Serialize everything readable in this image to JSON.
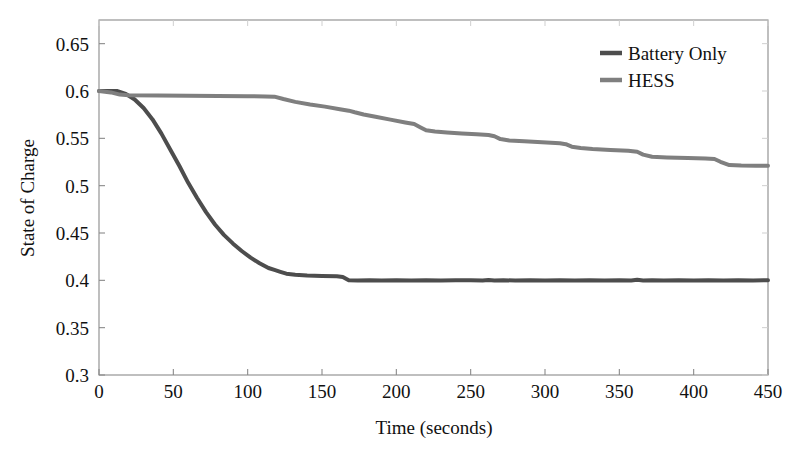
{
  "chart_data": {
    "type": "line",
    "title": "",
    "xlabel": "Time (seconds)",
    "ylabel": "State of Charge",
    "xlim": [
      0,
      450
    ],
    "ylim": [
      0.3,
      0.675
    ],
    "xticks": [
      0,
      50,
      100,
      150,
      200,
      250,
      300,
      350,
      400,
      450
    ],
    "xtick_labels": [
      "0",
      "50",
      "100",
      "150",
      "200",
      "250",
      "300",
      "350",
      "400",
      "450"
    ],
    "yticks": [
      0.3,
      0.35,
      0.4,
      0.45,
      0.5,
      0.55,
      0.6,
      0.65
    ],
    "ytick_labels": [
      "0.3",
      "0.35",
      "0.4",
      "0.45",
      "0.5",
      "0.55",
      "0.6",
      "0.65"
    ],
    "grid": false,
    "legend_position": "top-right",
    "series": [
      {
        "name": "Battery Only",
        "color": "#4d4d4d",
        "linewidth": 4.0,
        "x": [
          0,
          6,
          12,
          18,
          24,
          30,
          36,
          42,
          48,
          54,
          60,
          66,
          72,
          78,
          84,
          90,
          96,
          102,
          108,
          114,
          118,
          122,
          126,
          132,
          140,
          150,
          160,
          164,
          168,
          174,
          182,
          190,
          200,
          210,
          220,
          230,
          240,
          250,
          258,
          262,
          266,
          272,
          280,
          290,
          300,
          310,
          320,
          330,
          340,
          350,
          358,
          362,
          366,
          372,
          380,
          390,
          400,
          410,
          420,
          430,
          440,
          450
        ],
        "y": [
          0.6,
          0.6,
          0.6,
          0.597,
          0.591,
          0.582,
          0.57,
          0.555,
          0.538,
          0.521,
          0.503,
          0.487,
          0.472,
          0.459,
          0.448,
          0.439,
          0.431,
          0.424,
          0.418,
          0.413,
          0.411,
          0.409,
          0.407,
          0.406,
          0.405,
          0.4045,
          0.4042,
          0.4035,
          0.4,
          0.3998,
          0.4,
          0.3997,
          0.4,
          0.3998,
          0.4001,
          0.3998,
          0.4,
          0.4002,
          0.3999,
          0.4004,
          0.3999,
          0.4001,
          0.3998,
          0.4001,
          0.3999,
          0.4002,
          0.3998,
          0.4001,
          0.3999,
          0.4002,
          0.3999,
          0.4006,
          0.3999,
          0.4002,
          0.3999,
          0.4001,
          0.3999,
          0.4002,
          0.3999,
          0.4001,
          0.3999,
          0.4001
        ]
      },
      {
        "name": "HESS",
        "color": "#7f7f7f",
        "linewidth": 4.0,
        "x": [
          0,
          8,
          14,
          20,
          40,
          60,
          80,
          100,
          112,
          118,
          124,
          132,
          142,
          152,
          162,
          168,
          172,
          178,
          186,
          196,
          206,
          212,
          216,
          220,
          226,
          234,
          244,
          254,
          262,
          266,
          270,
          276,
          286,
          298,
          310,
          314,
          318,
          324,
          332,
          344,
          356,
          362,
          366,
          372,
          382,
          396,
          408,
          414,
          418,
          424,
          432,
          442,
          450
        ],
        "y": [
          0.6,
          0.5985,
          0.5962,
          0.5955,
          0.5952,
          0.595,
          0.5948,
          0.5945,
          0.5942,
          0.594,
          0.5915,
          0.5885,
          0.5858,
          0.5835,
          0.5808,
          0.5792,
          0.5775,
          0.5752,
          0.5728,
          0.5698,
          0.5668,
          0.5652,
          0.5618,
          0.5585,
          0.5572,
          0.5562,
          0.5552,
          0.5542,
          0.5535,
          0.5522,
          0.5492,
          0.5478,
          0.5468,
          0.5458,
          0.5448,
          0.5438,
          0.5412,
          0.5398,
          0.5388,
          0.5378,
          0.5368,
          0.5358,
          0.5328,
          0.5305,
          0.5298,
          0.5292,
          0.5288,
          0.5282,
          0.5252,
          0.5218,
          0.5212,
          0.5211,
          0.521
        ]
      }
    ]
  },
  "legend": {
    "entries": [
      {
        "label": "Battery Only",
        "color": "#4d4d4d"
      },
      {
        "label": "HESS",
        "color": "#7f7f7f"
      }
    ]
  },
  "axes": {
    "frame_color": "#8a8a8a"
  }
}
